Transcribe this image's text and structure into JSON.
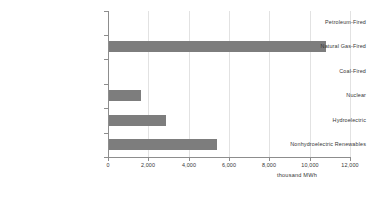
{
  "chart_data": {
    "type": "bar",
    "orientation": "horizontal",
    "title": "",
    "xlabel": "thousand MWh",
    "ylabel": "",
    "xlim": [
      0,
      12000
    ],
    "grid": true,
    "legend": false,
    "categories": [
      "Petroleum-Fired",
      "Natural Gas-Fired",
      "Coal-Fired",
      "Nuclear",
      "Hydroelectric",
      "Nonhydroelectric Renewables"
    ],
    "values": [
      0,
      10750,
      0,
      1580,
      2830,
      5350
    ],
    "xticks": [
      0,
      2000,
      4000,
      6000,
      8000,
      10000,
      12000
    ],
    "xtick_labels": [
      "0",
      "2,000",
      "4,000",
      "6,000",
      "8,000",
      "10,000",
      "12,000"
    ],
    "bar_color": "#7d7d7d",
    "grid_color": "#e2e2e2",
    "axis_color": "#8d8d8d",
    "text_color": "#363636",
    "background": "#ffffff"
  }
}
